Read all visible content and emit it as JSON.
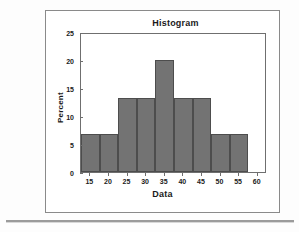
{
  "figure": {
    "title": "Histogram",
    "background_color": "#ffffff",
    "frame_color": "#8a8a8a"
  },
  "chart_data": {
    "type": "bar",
    "title": "Histogram",
    "xlabel": "Data",
    "ylabel": "Percent",
    "xlim": [
      12.5,
      62.5
    ],
    "ylim": [
      0,
      25
    ],
    "grid": false,
    "legend": false,
    "bar_color": "#737373",
    "bar_edge_color": "#4d4d4d",
    "bin_width": 5,
    "x_ticks": [
      15,
      20,
      25,
      30,
      35,
      40,
      45,
      50,
      55,
      60
    ],
    "x_tick_labels": [
      "15",
      "20",
      "25",
      "30",
      "35",
      "40",
      "45",
      "50",
      "55",
      "60"
    ],
    "y_ticks": [
      0,
      5,
      10,
      15,
      20,
      25
    ],
    "y_tick_labels": [
      "0",
      "5",
      "10",
      "15",
      "20",
      "25"
    ],
    "bins": [
      {
        "left": 12.5,
        "right": 17.5,
        "center": 15,
        "value": 6.7
      },
      {
        "left": 17.5,
        "right": 22.5,
        "center": 20,
        "value": 6.7
      },
      {
        "left": 22.5,
        "right": 27.5,
        "center": 25,
        "value": 13.3
      },
      {
        "left": 27.5,
        "right": 32.5,
        "center": 30,
        "value": 13.3
      },
      {
        "left": 32.5,
        "right": 37.5,
        "center": 35,
        "value": 20.0
      },
      {
        "left": 37.5,
        "right": 42.5,
        "center": 40,
        "value": 13.3
      },
      {
        "left": 42.5,
        "right": 47.5,
        "center": 45,
        "value": 13.3
      },
      {
        "left": 47.5,
        "right": 52.5,
        "center": 50,
        "value": 6.7
      },
      {
        "left": 52.5,
        "right": 57.5,
        "center": 55,
        "value": 6.7
      }
    ],
    "categories": [
      "15",
      "20",
      "25",
      "30",
      "35",
      "40",
      "45",
      "50",
      "55"
    ],
    "values": [
      6.7,
      6.7,
      13.3,
      13.3,
      20.0,
      13.3,
      13.3,
      6.7,
      6.7
    ]
  }
}
